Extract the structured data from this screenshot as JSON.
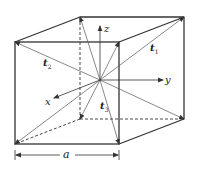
{
  "labels": {
    "z_axis": "z",
    "y_axis": "y",
    "x_axis": "x",
    "t1": "t",
    "t1_sub": "1",
    "t2": "t",
    "t2_sub": "2",
    "t3": "t",
    "t3_sub": "3",
    "edge": "a"
  },
  "colors": {
    "edge": "#333333",
    "vector": "#555555",
    "background": "#ffffff"
  },
  "geometry": {
    "center": [
      100,
      80
    ],
    "front_face": {
      "left": 15,
      "right": 119,
      "top": 42,
      "bottom": 144
    },
    "back_face": {
      "left": 80,
      "right": 184,
      "top": 17,
      "bottom": 119
    }
  }
}
